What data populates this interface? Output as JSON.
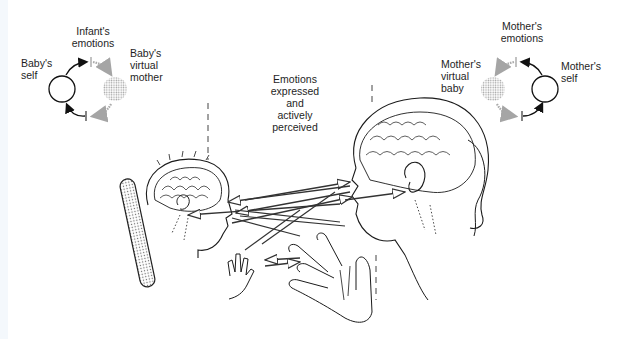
{
  "figure": {
    "type": "diagram"
  },
  "labels": {
    "babys_self": "Baby's\nself",
    "infants_emotions": "Infant's\nemotions",
    "babys_virtual_mother": "Baby's\nvirtual\nmother",
    "center_caption": "Emotions\nexpressed\nand\nactively\nperceived",
    "mothers_virtual_baby": "Mother's\nvirtual\nbaby",
    "mothers_emotions": "Mother's\nemotions",
    "mothers_self": "Mother's\nself"
  },
  "loops": {
    "baby": {
      "self_circle": "open",
      "virtual_circle": "dotted-gray",
      "arrow_color_self": "#111111",
      "arrow_color_virtual": "#9a9a9a"
    },
    "mother": {
      "self_circle": "open",
      "virtual_circle": "dotted-gray",
      "arrow_color_self": "#111111",
      "arrow_color_virtual": "#9a9a9a"
    }
  },
  "colors": {
    "line": "#1a1a1a",
    "gray_arrow": "#9a9a9a",
    "stipple": "#c8c8c8",
    "background": "#ffffff"
  }
}
